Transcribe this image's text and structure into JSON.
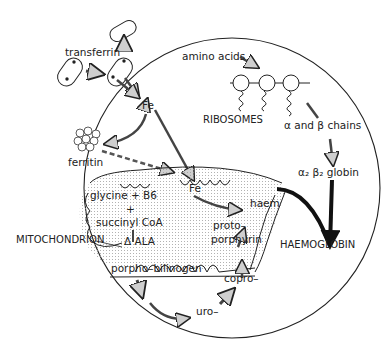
{
  "diagram": {
    "labels": {
      "transferrin": "transferrin",
      "fe_top": "Fe",
      "ferritin": "ferritin",
      "amino_acids": "amino acids",
      "ribosomes": "RIBOSOMES",
      "alpha_beta_chains": "α and β chains",
      "globin": "α₂ β₂ globin",
      "glycine": "glycine + B6",
      "plus": "+",
      "succinyl": "succinyl CoA",
      "fe_mito": "Fe",
      "haem": "haem",
      "protoporphyrin_1": "proto–",
      "protoporphyrin_2": "porphyrin",
      "mitochondrion": "MITOCHONDRION",
      "ala": "Δ ALA",
      "porphobilinogen": "porpho–bilinogen",
      "copro": "copro–",
      "uro": "uro–",
      "haemoglobin": "HAEMOGLOBIN"
    },
    "colors": {
      "line": "#222222",
      "arrow_fill": "#cfcfcf",
      "stipple": "#bbbbbb"
    }
  }
}
